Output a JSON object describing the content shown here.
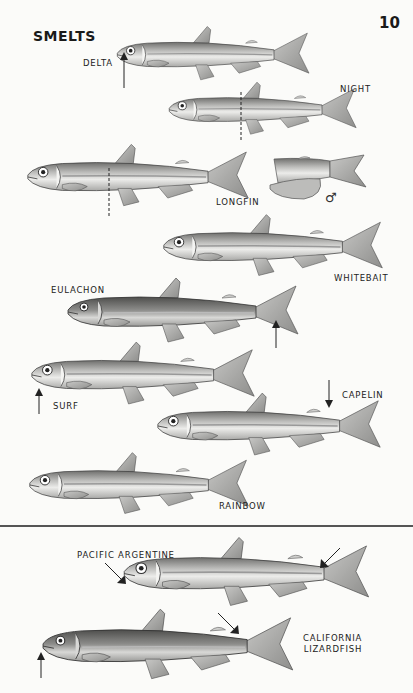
{
  "page": {
    "title": "SMELTS",
    "page_number": "10"
  },
  "fish": [
    {
      "name": "DELTA",
      "label": "DELTA"
    },
    {
      "name": "NIGHT",
      "label": "NIGHT"
    },
    {
      "name": "LONGFIN",
      "label": "LONGFIN",
      "inset_symbol": "♂"
    },
    {
      "name": "WHITEBAIT",
      "label": "WHITEBAIT"
    },
    {
      "name": "EULACHON",
      "label": "EULACHON"
    },
    {
      "name": "SURF",
      "label": "SURF"
    },
    {
      "name": "CAPELIN",
      "label": "CAPELIN"
    },
    {
      "name": "RAINBOW",
      "label": "RAINBOW"
    }
  ],
  "lower_section": [
    {
      "name": "PACIFIC ARGENTINE",
      "label": "PACIFIC ARGENTINE"
    },
    {
      "name": "CALIFORNIA LIZARDFISH",
      "label_line1": "CALIFORNIA",
      "label_line2": "LIZARDFISH"
    }
  ],
  "colors": {
    "background": "#fbfbf9",
    "ink": "#1a1a1a",
    "body_light": "#e4e4e2",
    "body_dark": "#8a8a88"
  }
}
